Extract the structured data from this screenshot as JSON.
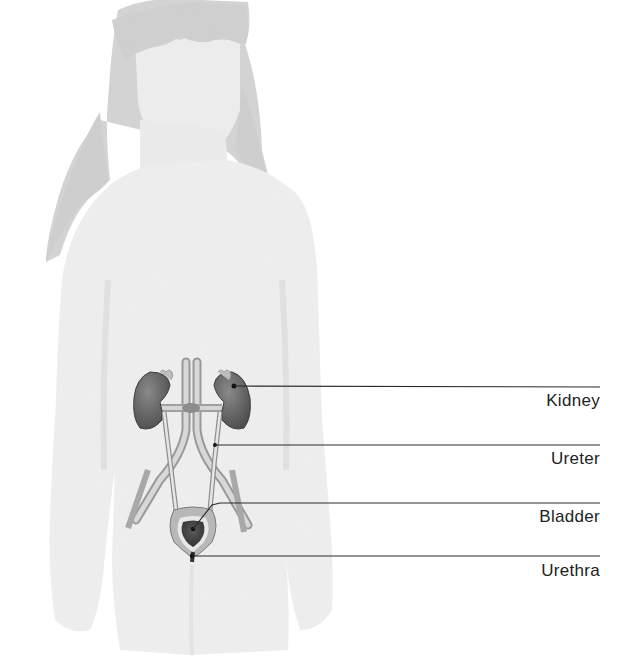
{
  "diagram": {
    "figure": "child-silhouette",
    "colors": {
      "background": "#ffffff",
      "body": "#ededed",
      "hair": "#d2d2d2",
      "organ": "#6e6e6e",
      "organ_dark": "#4a4a4a",
      "vessel": "#bdbdbd",
      "leader_line": "#2a2a2a"
    },
    "labels": [
      {
        "id": "kidney",
        "text": "Kidney",
        "line_y": 387,
        "text_y": 391,
        "anchor_x": 234,
        "anchor_y": 386
      },
      {
        "id": "ureter",
        "text": "Ureter",
        "line_y": 445,
        "text_y": 449,
        "anchor_x": 215,
        "anchor_y": 445
      },
      {
        "id": "bladder",
        "text": "Bladder",
        "line_y": 503,
        "text_y": 507,
        "anchor_x": 200,
        "anchor_y": 528
      },
      {
        "id": "urethra",
        "text": "Urethra",
        "line_y": 556,
        "text_y": 561,
        "anchor_x": 192,
        "anchor_y": 556
      }
    ]
  }
}
